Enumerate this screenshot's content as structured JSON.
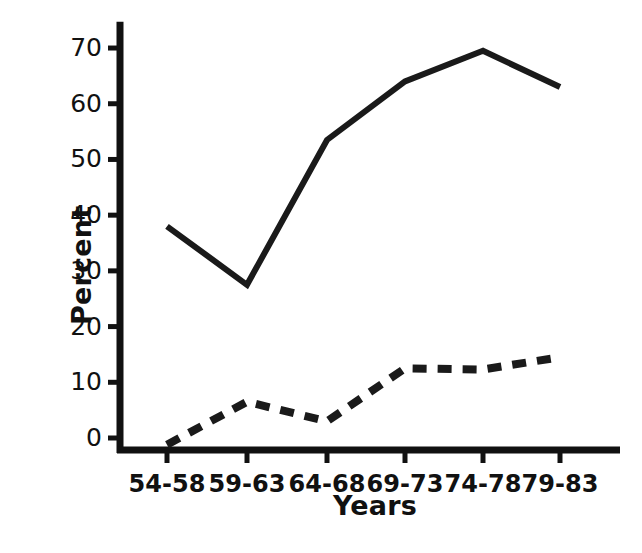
{
  "chart_data": {
    "type": "line",
    "title": "",
    "xlabel": "Years",
    "ylabel": "Percent",
    "categories": [
      "54-58",
      "59-63",
      "64-68",
      "69-73",
      "74-78",
      "79-83"
    ],
    "ylim": [
      -2,
      74
    ],
    "xlim": [
      0,
      7
    ],
    "yticks": [
      0,
      10,
      20,
      30,
      40,
      50,
      60,
      70
    ],
    "ytick_labels": [
      "0",
      "10",
      "20",
      "30",
      "40",
      "50",
      "60",
      "70"
    ],
    "grid": false,
    "legend": "none",
    "series": [
      {
        "name": "solid-series",
        "style": "solid",
        "color": "#1a1a1a",
        "values": [
          38,
          27.5,
          53.5,
          64,
          69.5,
          63
        ]
      },
      {
        "name": "dashed-series",
        "style": "dashed",
        "color": "#1a1a1a",
        "values": [
          -1.2,
          6.5,
          3,
          12.5,
          12.3,
          14.5
        ]
      }
    ]
  },
  "axes": {
    "y_title": "Percent",
    "x_title": "Years",
    "axis_color": "#111111"
  },
  "geometry": {
    "x_positions": [
      167,
      247,
      327,
      405,
      483,
      560
    ],
    "y_axis_x": 120,
    "x_axis_y": 450,
    "y_zero": 438,
    "px_per_unit": 5.571
  }
}
